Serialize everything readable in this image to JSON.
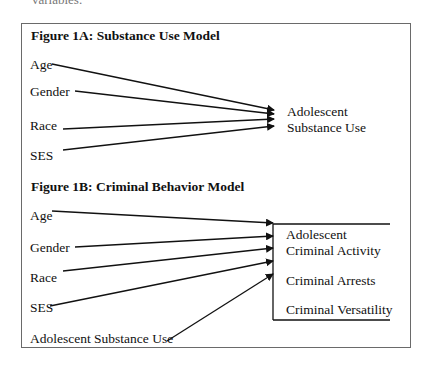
{
  "page": {
    "cutoff_text": "variables."
  },
  "figure_1a": {
    "title": "Figure 1A: Substance Use Model",
    "predictors": [
      "Age",
      "Gender",
      "Race",
      "SES"
    ],
    "outcome_line1": "Adolescent",
    "outcome_line2": "Substance Use"
  },
  "figure_1b": {
    "title": "Figure 1B: Criminal Behavior Model",
    "predictors": [
      "Age",
      "Gender",
      "Race",
      "SES",
      "Adolescent Substance Use"
    ],
    "outcomes": {
      "group_line1": "Adolescent",
      "group_line2": "Criminal Activity",
      "item2": "Criminal Arrests",
      "item3": "Criminal Versatility"
    }
  },
  "colors": {
    "line": "#111111",
    "frame": "#6a6a6a"
  }
}
